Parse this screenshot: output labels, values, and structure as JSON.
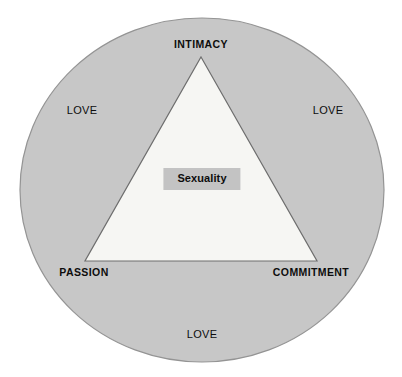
{
  "diagram": {
    "name": "triangular-theory-of-love",
    "shapes": {
      "circle": {
        "label": "outer-circle",
        "fill": "#c7c7c7",
        "stroke": "#8f8f8f",
        "cx": 202,
        "cy": 190,
        "rx": 182,
        "ry": 172
      },
      "triangle": {
        "label": "love-triangle",
        "fill": "#f6f6f3",
        "stroke": "#6e6e6e",
        "apex": [
          201,
          57
        ],
        "bottom_left": [
          85,
          261
        ],
        "bottom_right": [
          317,
          261
        ]
      }
    },
    "vertices": [
      {
        "key": "intimacy",
        "label": "INTIMACY"
      },
      {
        "key": "passion",
        "label": "PASSION"
      },
      {
        "key": "commitment",
        "label": "COMMITMENT"
      }
    ],
    "sides": [
      {
        "key": "love-left",
        "label": "LOVE"
      },
      {
        "key": "love-right",
        "label": "LOVE"
      },
      {
        "key": "love-bottom",
        "label": "LOVE"
      }
    ],
    "center": {
      "key": "sexuality",
      "label": "Sexuality",
      "box_fill": "#c3c3c3"
    },
    "colors": {
      "background": "#ffffff",
      "circle_fill": "#c7c7c7",
      "circle_stroke": "#8f8f8f",
      "triangle_fill": "#f6f6f3",
      "triangle_stroke": "#6e6e6e",
      "text": "#0d0d0d",
      "highlight_box": "#c3c3c3"
    }
  }
}
